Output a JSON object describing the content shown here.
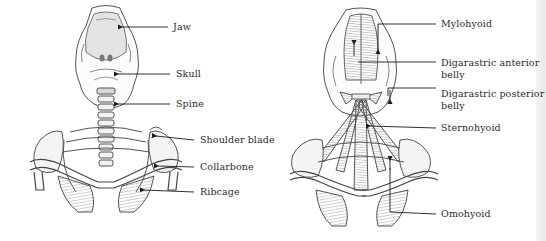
{
  "figures": [
    {
      "id": "skeleton",
      "title": "Skeleton",
      "labels": [
        {
          "text": "Jaw",
          "x": 171,
          "y": 21
        },
        {
          "text": "Skull",
          "x": 176,
          "y": 68
        },
        {
          "text": "Spine",
          "x": 176,
          "y": 99
        },
        {
          "text": "Shoulder blade",
          "x": 200,
          "y": 134
        },
        {
          "text": "Collarbone",
          "x": 200,
          "y": 161
        },
        {
          "text": "Ribcage",
          "x": 200,
          "y": 186
        }
      ]
    },
    {
      "id": "muscles",
      "title": "Neck muscles",
      "labels": [
        {
          "text": "Mylohyoid",
          "x": 441,
          "y": 18
        },
        {
          "text": "Digarastric anterior",
          "text2": "belly",
          "x": 441,
          "y": 58
        },
        {
          "text": "Digarastric posterior",
          "text2": "belly",
          "x": 441,
          "y": 89
        },
        {
          "text": "Sternohyoid",
          "x": 441,
          "y": 122
        },
        {
          "text": "Omohyoid",
          "x": 441,
          "y": 208
        }
      ]
    }
  ],
  "colors": {
    "background": "#ffffff",
    "ink": "#2a2a2a",
    "sketch": "#555555",
    "shade": "#9a9a9a"
  }
}
